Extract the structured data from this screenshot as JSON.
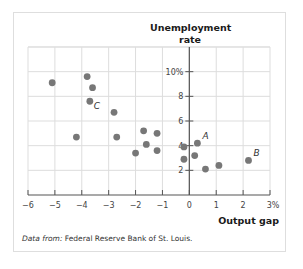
{
  "chart_data": {
    "type": "scatter",
    "title": "",
    "xlabel": "Output gap",
    "ylabel": "Unemployment rate",
    "xlim": [
      -6,
      3
    ],
    "ylim": [
      0,
      12
    ],
    "x_ticks": [
      "-6",
      "-5",
      "-4",
      "-3",
      "-2",
      "-1",
      "0",
      "1",
      "2",
      "3%"
    ],
    "y_ticks": [
      "2",
      "4",
      "6",
      "8",
      "10%"
    ],
    "grid": true,
    "legend": null,
    "points": [
      {
        "x": -5.1,
        "y": 9.1
      },
      {
        "x": -3.8,
        "y": 9.6
      },
      {
        "x": -3.6,
        "y": 8.7
      },
      {
        "x": -3.7,
        "y": 7.6,
        "label": "C"
      },
      {
        "x": -2.8,
        "y": 6.7
      },
      {
        "x": -4.2,
        "y": 4.7
      },
      {
        "x": -2.7,
        "y": 4.7
      },
      {
        "x": -1.7,
        "y": 5.2
      },
      {
        "x": -1.2,
        "y": 5.0
      },
      {
        "x": -1.6,
        "y": 4.1
      },
      {
        "x": -2.0,
        "y": 3.4
      },
      {
        "x": -1.2,
        "y": 3.6
      },
      {
        "x": -0.2,
        "y": 3.9
      },
      {
        "x": 0.3,
        "y": 4.2,
        "label": "A"
      },
      {
        "x": -0.2,
        "y": 2.9
      },
      {
        "x": 0.2,
        "y": 3.2
      },
      {
        "x": 0.6,
        "y": 2.1
      },
      {
        "x": 1.1,
        "y": 2.4
      },
      {
        "x": 2.2,
        "y": 2.8,
        "label": "B"
      }
    ],
    "colors": {
      "point": "#777777",
      "grid": "#dddddd",
      "axis": "#555555"
    }
  },
  "labels": {
    "y_title_line1": "Unemployment",
    "y_title_line2": "rate",
    "x_title": "Output gap",
    "source_prefix": "Data from:",
    "source_text": " Federal Reserve Bank of St. Louis."
  }
}
